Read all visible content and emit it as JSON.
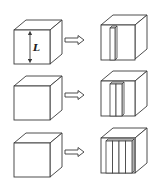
{
  "diagram": {
    "dimension_label": "L",
    "colors": {
      "stroke": "#3a3a3a",
      "fill": "#ffffff",
      "background": "#ffffff"
    },
    "rows": [
      {
        "source": "cube",
        "arrow": "right-hollow-arrow",
        "result_slabs": 1
      },
      {
        "source": "cube",
        "arrow": "right-hollow-arrow",
        "result_slabs": 2
      },
      {
        "source": "cube",
        "arrow": "right-hollow-arrow",
        "result_slabs": 4
      }
    ]
  }
}
